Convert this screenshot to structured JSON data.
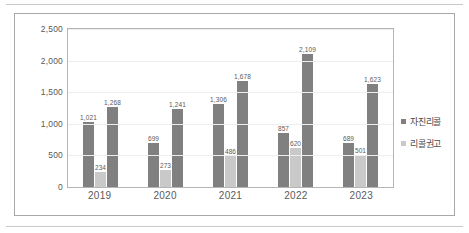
{
  "chart_data": {
    "type": "bar",
    "title": "",
    "subtitle": "",
    "xlabel": "",
    "ylabel": "",
    "categories": [
      "2019",
      "2020",
      "2021",
      "2022",
      "2023"
    ],
    "ylim": [
      0,
      2500
    ],
    "yticks": [
      "0",
      "500",
      "1,000",
      "1,500",
      "2,000",
      "2,500"
    ],
    "ytick_values": [
      0,
      500,
      1000,
      1500,
      2000,
      2500
    ],
    "grid": true,
    "legend_position": "right",
    "legend": [
      "자진리콜",
      "리콜권고"
    ],
    "series": [
      {
        "name": "자진리콜",
        "color": "#808080",
        "values": [
          1021,
          699,
          1306,
          857,
          689
        ],
        "labels": [
          "1,021",
          "699",
          "1,306",
          "857",
          "689"
        ]
      },
      {
        "name": "리콜권고",
        "color": "#c9c9c9",
        "values": [
          234,
          273,
          486,
          620,
          501
        ],
        "labels": [
          "234",
          "273",
          "486",
          "620",
          "501"
        ]
      },
      {
        "name": "자진리콜",
        "color": "#808080",
        "values": [
          1268,
          1241,
          1678,
          2109,
          1623
        ],
        "labels": [
          "1,268",
          "1,241",
          "1,678",
          "2,109",
          "1,623"
        ]
      }
    ]
  },
  "legend": {
    "items": [
      {
        "label": "자진리콜",
        "color": "#808080"
      },
      {
        "label": "리콜권고",
        "color": "#c9c9c9"
      }
    ]
  }
}
